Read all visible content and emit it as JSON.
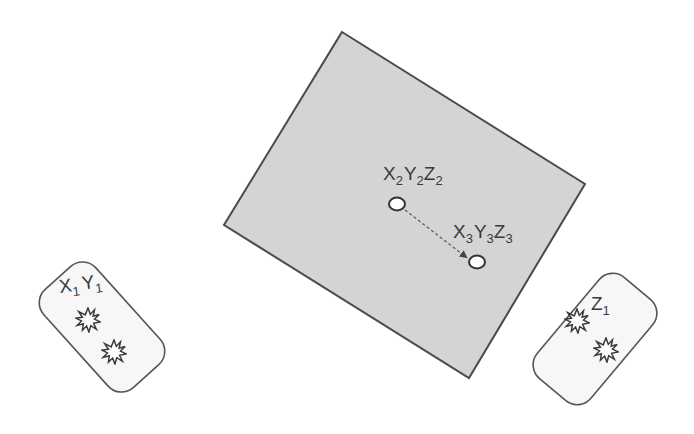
{
  "diagram": {
    "colors": {
      "background": "#ffffff",
      "field_fill": "#d4d4d4",
      "field_stroke": "#4a4a4a",
      "card_fill": "#f7f7f7",
      "card_stroke": "#555555",
      "point_fill": "#ffffff",
      "point_stroke": "#3a3a3a",
      "arrow": "#555555",
      "text": "#3a3a3a"
    },
    "field": {
      "label": "projection-area",
      "points": [
        {
          "id": "p2",
          "label_main": [
            "X",
            "Y",
            "Z"
          ],
          "label_sub": [
            "2",
            "2",
            "2"
          ]
        },
        {
          "id": "p3",
          "label_main": [
            "X",
            "Y",
            "Z"
          ],
          "label_sub": [
            "3",
            "3",
            "3"
          ]
        }
      ],
      "arrow": {
        "from": "p2",
        "to": "p3",
        "style": "dashed"
      }
    },
    "cards": [
      {
        "id": "left-card",
        "label_main": [
          "X",
          "Y"
        ],
        "label_sub": [
          "1",
          "1"
        ],
        "bursts": 2
      },
      {
        "id": "right-card",
        "label_main": [
          "Z"
        ],
        "label_sub": [
          "1"
        ],
        "bursts": 2
      }
    ]
  }
}
